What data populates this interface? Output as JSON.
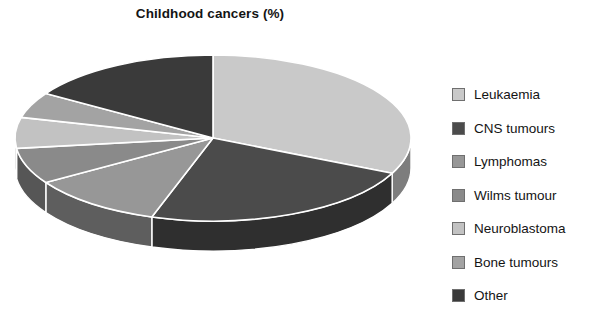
{
  "title": "Childhood cancers (%)",
  "bottom_caption": "",
  "legend": {
    "items": [
      {
        "label": "Leukaemia",
        "color": "#c9c9c9"
      },
      {
        "label": "CNS tumours",
        "color": "#4b4b4b"
      },
      {
        "label": "Lymphomas",
        "color": "#979797"
      },
      {
        "label": "Wilms tumour",
        "color": "#8a8a8a"
      },
      {
        "label": "Neuroblastoma",
        "color": "#c2c2c2"
      },
      {
        "label": "Bone tumours",
        "color": "#a3a3a3"
      },
      {
        "label": "Other",
        "color": "#3a3a3a"
      }
    ]
  },
  "chart_data": {
    "type": "pie",
    "title": "Childhood cancers (%)",
    "unit": "%",
    "three_d": true,
    "start_angle_deg": 0,
    "direction": "clockwise",
    "legend_position": "right",
    "categories": [
      "Leukaemia",
      "CNS tumours",
      "Lymphomas",
      "Wilms tumour",
      "Neuroblastoma",
      "Bone tumours",
      "Other"
    ],
    "values": [
      32,
      23,
      11,
      7,
      6,
      5,
      16
    ],
    "colors": [
      "#c9c9c9",
      "#4b4b4b",
      "#979797",
      "#8a8a8a",
      "#c2c2c2",
      "#a3a3a3",
      "#3a3a3a"
    ],
    "geometry": {
      "center_x": 213,
      "center_y": 110,
      "radius_x": 198,
      "radius_y": 83,
      "depth": 30
    },
    "style": {
      "slice_border": "#ffffff",
      "side_wall_darken": 0.62,
      "background": "#ffffff"
    }
  }
}
